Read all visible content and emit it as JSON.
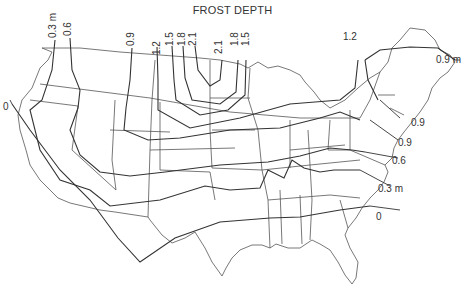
{
  "title": "FROST DEPTH",
  "unit": "m",
  "map_region": "Contiguous United States",
  "contour_labels": {
    "top": [
      {
        "id": "west-0.3",
        "text": "0.3 m"
      },
      {
        "id": "west-0.6",
        "text": "0.6"
      },
      {
        "id": "n-0.9",
        "text": "0.9"
      },
      {
        "id": "n-1.2",
        "text": "1.2"
      },
      {
        "id": "n-1.5a",
        "text": "1.5"
      },
      {
        "id": "n-1.8a",
        "text": "1.8"
      },
      {
        "id": "n-2.1a",
        "text": "2.1"
      },
      {
        "id": "n-2.1b",
        "text": "2.1"
      },
      {
        "id": "n-1.8b",
        "text": "1.8"
      },
      {
        "id": "n-1.5b",
        "text": "1.5"
      },
      {
        "id": "ne-1.2",
        "text": "1.2"
      }
    ],
    "left": [
      {
        "id": "w-0",
        "text": "0"
      }
    ],
    "right": [
      {
        "id": "e-0.9m",
        "text": "0.9 m"
      },
      {
        "id": "e-0.9a",
        "text": "0.9"
      },
      {
        "id": "e-0.9b",
        "text": "0.9"
      },
      {
        "id": "e-0.6",
        "text": "0.6"
      },
      {
        "id": "e-0.3m",
        "text": "0.3 m"
      },
      {
        "id": "e-0",
        "text": "0"
      }
    ]
  },
  "colors": {
    "line": "#333333",
    "border": "#555555",
    "background": "#ffffff"
  }
}
